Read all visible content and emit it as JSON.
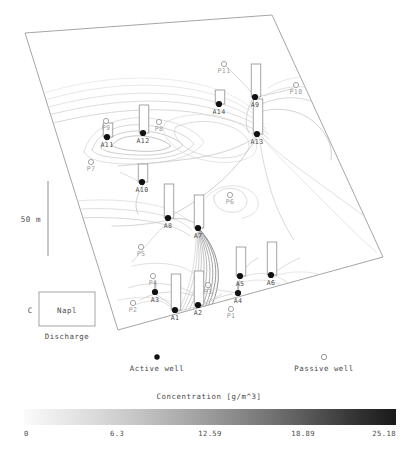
{
  "figure": {
    "scalebar_label": "50 m",
    "source_box": {
      "label": "Napl",
      "caption": "Discharge",
      "prefix": "C"
    }
  },
  "legend": {
    "active_label": "Active well",
    "passive_label": "Passive well"
  },
  "chart_data": {
    "type": "heatmap",
    "title": "Concentration [g/m^3]",
    "xlabel": "",
    "ylabel": "",
    "colorbar": {
      "title": "Concentration [g/m^3]",
      "ticks": [
        0,
        6.3,
        12.59,
        18.89,
        25.18
      ],
      "tick_labels": [
        "0",
        "6.3",
        "12.59",
        "18.89",
        "25.18"
      ],
      "vmin": 0,
      "vmax": 25.18,
      "colormap": "grayscale",
      "low_color": "#fbfbfb",
      "high_color": "#1a1a1a",
      "orientation": "horizontal"
    },
    "grid": false,
    "legend_position": "below-plot",
    "domain_polygon": [
      [
        25,
        33
      ],
      [
        272,
        15
      ],
      [
        383,
        257
      ],
      [
        118,
        330
      ]
    ],
    "scalebar": {
      "label": "50 m",
      "x": 48,
      "y_top": 181,
      "y_bottom": 256
    },
    "series": [
      {
        "name": "Active well",
        "marker": "filled-circle",
        "color": "#111111",
        "points": [
          {
            "label": "A1",
            "x": 175,
            "y": 310,
            "bar_height": 36
          },
          {
            "label": "A2",
            "x": 198,
            "y": 305,
            "bar_height": 34
          },
          {
            "label": "A3",
            "x": 155,
            "y": 292,
            "bar_height": 0
          },
          {
            "label": "A4",
            "x": 238,
            "y": 293,
            "bar_height": 0
          },
          {
            "label": "A5",
            "x": 240,
            "y": 276,
            "bar_height": 29
          },
          {
            "label": "A6",
            "x": 271,
            "y": 275,
            "bar_height": 33
          },
          {
            "label": "A7",
            "x": 198,
            "y": 228,
            "bar_height": 33
          },
          {
            "label": "A8",
            "x": 168,
            "y": 218,
            "bar_height": 34
          },
          {
            "label": "A10",
            "x": 142,
            "y": 182,
            "bar_height": 18
          },
          {
            "label": "A11",
            "x": 107,
            "y": 137,
            "bar_height": 14
          },
          {
            "label": "A12",
            "x": 143,
            "y": 133,
            "bar_height": 28
          },
          {
            "label": "A13",
            "x": 257,
            "y": 134,
            "bar_height": 35
          },
          {
            "label": "A14",
            "x": 219,
            "y": 104,
            "bar_height": 14
          },
          {
            "label": "A9",
            "x": 255,
            "y": 97,
            "bar_height": 33
          }
        ]
      },
      {
        "name": "Passive well",
        "marker": "open-circle",
        "color": "#9a9a9a",
        "points": [
          {
            "label": "P1",
            "x": 231,
            "y": 309
          },
          {
            "label": "P2",
            "x": 133,
            "y": 303
          },
          {
            "label": "P3",
            "x": 208,
            "y": 285
          },
          {
            "label": "P4",
            "x": 153,
            "y": 276
          },
          {
            "label": "P5",
            "x": 141,
            "y": 247
          },
          {
            "label": "P6",
            "x": 230,
            "y": 195
          },
          {
            "label": "P7",
            "x": 91,
            "y": 162
          },
          {
            "label": "P8",
            "x": 159,
            "y": 122
          },
          {
            "label": "P9",
            "x": 106,
            "y": 121
          },
          {
            "label": "P10",
            "x": 296,
            "y": 85
          },
          {
            "label": "P11",
            "x": 224,
            "y": 64
          }
        ]
      }
    ],
    "contour_note": "Grayscale plume contours emanating from active wells, advecting toward lower-left"
  }
}
